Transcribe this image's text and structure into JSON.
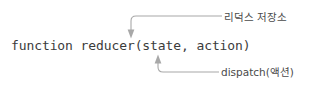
{
  "diagram": {
    "background_color": "#ffffff",
    "line_color": "#a8a8a8",
    "code_text_color": "#3b3b3b",
    "label_text_color": "#4a4a4a",
    "code": {
      "signature": "function reducer(state, action)"
    },
    "callouts": [
      {
        "id": "store",
        "label": "리덕스 저장소",
        "points_to": "reducer",
        "arrow_direction": "down"
      },
      {
        "id": "dispatch",
        "label": "dispatch(액션)",
        "points_to": "action",
        "arrow_direction": "up"
      }
    ]
  }
}
